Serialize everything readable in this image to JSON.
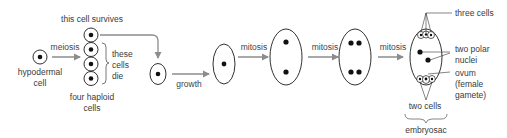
{
  "diagram": {
    "colors": {
      "outline": "#1a1a1a",
      "nucleus": "#111111",
      "arrow": "#8c8c8c",
      "text": "#3a3a3a",
      "background": "#ffffff"
    },
    "labels": {
      "survives": "this cell survives",
      "meiosis": "meiosis",
      "hypodermal_1": "hypodermal",
      "hypodermal_2": "cell",
      "die_1": "these",
      "die_2": "cells",
      "die_3": "die",
      "haploid_1": "four haploid",
      "haploid_2": "cells",
      "growth": "growth",
      "mitosis_1": "mitosis",
      "mitosis_2": "mitosis",
      "mitosis_3": "mitosis",
      "three_cells": "three cells",
      "polar_1": "two polar",
      "polar_2": "nuclei",
      "ovum_1": "ovum",
      "ovum_2": "(female",
      "ovum_3": "gamete)",
      "two_cells": "two cells",
      "embryosac": "embryosac"
    },
    "stages": [
      {
        "name": "hypodermal cell",
        "nuclei": 1
      },
      {
        "name": "four haploid cells",
        "nuclei": 4
      },
      {
        "name": "surviving cell",
        "nuclei": 1
      },
      {
        "name": "grown cell",
        "nuclei": 1
      },
      {
        "name": "after first mitosis",
        "nuclei": 2
      },
      {
        "name": "after second mitosis",
        "nuclei": 4
      },
      {
        "name": "embryosac",
        "nuclei": 8
      }
    ]
  }
}
